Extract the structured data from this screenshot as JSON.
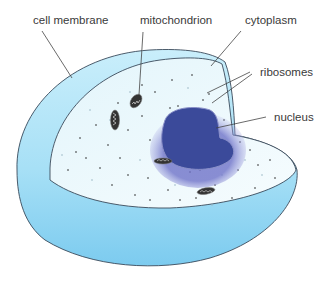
{
  "diagram": {
    "type": "animal-cell-cutaway",
    "labels": {
      "cell_membrane": "cell membrane",
      "mitochondrion": "mitochondrion",
      "cytoplasm": "cytoplasm",
      "ribosomes": "ribosomes",
      "nucleus": "nucleus"
    },
    "colors": {
      "membrane_fill": "#8fd3f0",
      "membrane_light": "#c4ecfa",
      "cytoplasm_fill": "#eef9fd",
      "nucleus_fill": "#3b4a9a",
      "nucleus_glow": "#7b7fd0",
      "outline": "#3a4a5a",
      "leader_line": "#444444",
      "mitochondrion_fill": "#333333"
    }
  }
}
